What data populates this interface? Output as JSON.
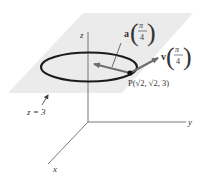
{
  "diagram": {
    "colors": {
      "plane": "#ebebeb",
      "axes": "#555555",
      "ellipse": "#1a1a1a",
      "vector": "#6e6e6e",
      "text": "#333333",
      "point": "#111111"
    },
    "axes": {
      "x_label": "x",
      "y_label": "y",
      "z_label": "z"
    },
    "plane": {
      "label": "z = 3"
    },
    "point": {
      "label": "P(√2, √2, 3)",
      "name": "P",
      "coords": [
        "√2",
        "√2",
        "3"
      ]
    },
    "vectors": {
      "acceleration": {
        "symbol": "a",
        "arg_numerator": "π",
        "arg_denominator": "4"
      },
      "velocity": {
        "symbol": "v",
        "arg_numerator": "π",
        "arg_denominator": "4"
      }
    }
  }
}
